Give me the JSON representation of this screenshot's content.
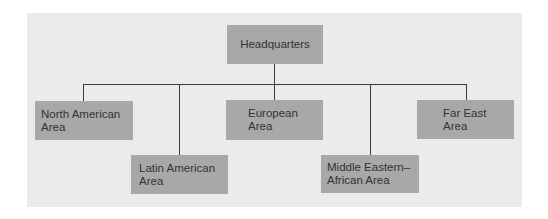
{
  "diagram": {
    "type": "org-chart",
    "root": {
      "id": "hq",
      "label": "Headquarters"
    },
    "children": [
      {
        "id": "north-american",
        "label": "North American\nArea"
      },
      {
        "id": "latin-american",
        "label": "Latin American\nArea"
      },
      {
        "id": "european",
        "label": "European\nArea"
      },
      {
        "id": "middle-eastern-african",
        "label": "Middle Eastern–\nAfrican Area"
      },
      {
        "id": "far-east",
        "label": "Far East\nArea"
      }
    ],
    "colors": {
      "background": "#ebebeb",
      "box_fill": "#a8a8a8",
      "connector": "#3a3a3a",
      "text": "#333333"
    }
  }
}
